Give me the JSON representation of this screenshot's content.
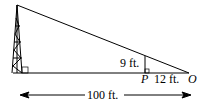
{
  "diagram": {
    "type": "similar-triangles-tower",
    "labels": {
      "height_small": "9 ft.",
      "point_p": "P",
      "segment_po": "12 ft.",
      "point_o": "O",
      "total_distance": "100 ft."
    },
    "icons": [
      "tower-icon",
      "right-angle-marker",
      "double-arrow"
    ],
    "colors": {
      "stroke": "#000000",
      "background": "#ffffff"
    }
  }
}
